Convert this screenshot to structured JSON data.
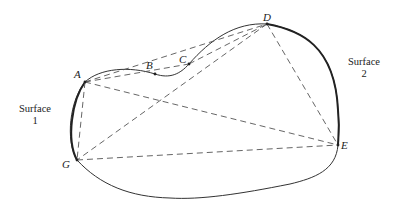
{
  "diagram": {
    "points": [
      {
        "id": "A",
        "label": "A",
        "x": 85,
        "y": 82,
        "lx": 74,
        "ly": 78
      },
      {
        "id": "B",
        "label": "B",
        "x": 155,
        "y": 74,
        "lx": 146,
        "ly": 69
      },
      {
        "id": "C",
        "label": "C",
        "x": 189,
        "y": 64,
        "lx": 179,
        "ly": 63
      },
      {
        "id": "D",
        "label": "D",
        "x": 267,
        "y": 24,
        "lx": 263,
        "ly": 21
      },
      {
        "id": "E",
        "label": "E",
        "x": 338,
        "y": 145,
        "lx": 341,
        "ly": 149
      },
      {
        "id": "G",
        "label": "G",
        "x": 77,
        "y": 160,
        "lx": 62,
        "ly": 168
      }
    ],
    "surfaces": [
      {
        "id": "surface-1",
        "line1": "Surface",
        "line2": "1",
        "x": 35,
        "y1": 112,
        "y2": 124
      },
      {
        "id": "surface-2",
        "line1": "Surface",
        "line2": "2",
        "x": 364,
        "y1": 65,
        "y2": 77
      }
    ],
    "dashed_connections": [
      [
        "A",
        "C"
      ],
      [
        "A",
        "D"
      ],
      [
        "A",
        "E"
      ],
      [
        "A",
        "G"
      ],
      [
        "C",
        "D"
      ],
      [
        "D",
        "E"
      ],
      [
        "D",
        "G"
      ],
      [
        "G",
        "E"
      ]
    ],
    "colors": {
      "line": "#333333",
      "dash": "#555555",
      "background": "#ffffff"
    }
  }
}
